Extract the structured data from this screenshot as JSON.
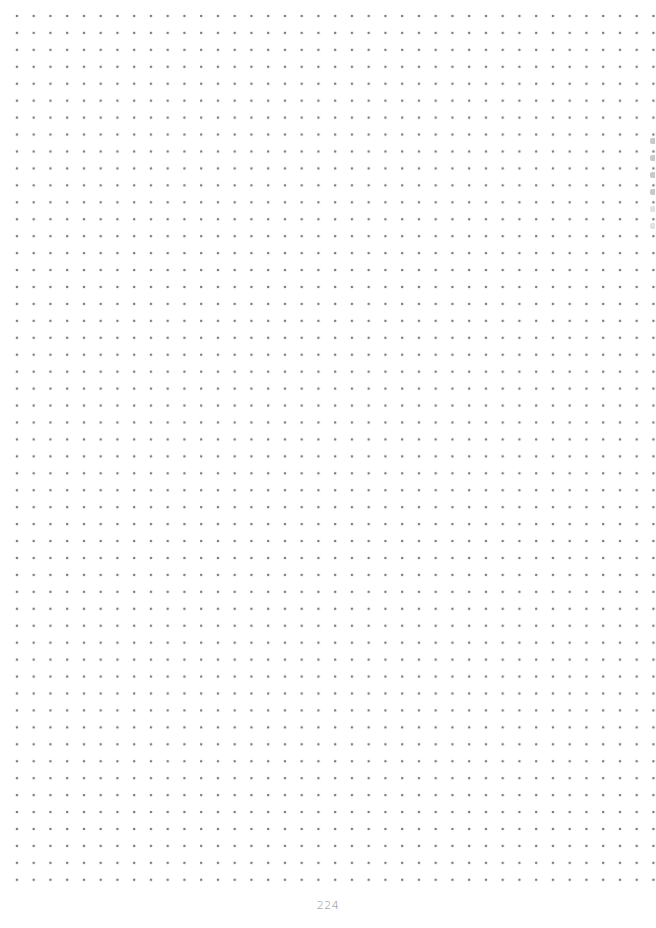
{
  "page": {
    "type": "dot-grid notebook page",
    "page_number": "224",
    "grid": {
      "dot_color": "#7a7a7a",
      "spacing_px": 17,
      "columns": 38,
      "rows": 52
    },
    "edge_marks": {
      "count": 6,
      "color": "#c9c9c9"
    }
  }
}
